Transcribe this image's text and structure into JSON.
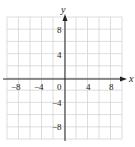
{
  "chart_data": {
    "type": "line",
    "title": "",
    "xlabel": "x",
    "ylabel": "y",
    "xlim": [
      -10,
      10
    ],
    "ylim": [
      -10,
      10
    ],
    "grid": true,
    "grid_step": 2,
    "x_ticks": [
      -8,
      -4,
      0,
      4,
      8
    ],
    "y_ticks": [
      8,
      4,
      -4,
      -8
    ],
    "x_tick_labels": [
      "−8",
      "−4",
      "0",
      "4",
      "8"
    ],
    "y_tick_labels": [
      "8",
      "4",
      "−4",
      "−8"
    ],
    "series": [],
    "colors": {
      "grid": "#d4d4d4",
      "axis": "#222222",
      "background": "#ffffff"
    }
  }
}
